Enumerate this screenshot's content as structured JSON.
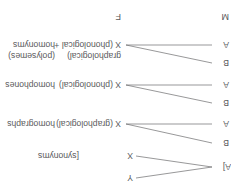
{
  "figure": {
    "orientation": "rotated-180",
    "background_color": "#ffffff",
    "text_color": "#59595b",
    "line_color": "#6b6b6d"
  },
  "headers": {
    "meaning": "M",
    "form": "F"
  },
  "rows": [
    {
      "id": "synonyms",
      "meaning_labels": [
        "A]"
      ],
      "form_labels": [
        "X",
        "Y"
      ],
      "relation_label": "[synonyms",
      "relation_label_full": "[synonyms]",
      "link_type": "one-to-many"
    },
    {
      "id": "homographs",
      "meaning_labels": [
        "A",
        "B"
      ],
      "form_labels": [
        "X (graphological)"
      ],
      "relation_label": "homographs",
      "link_type": "many-to-one"
    },
    {
      "id": "homophones",
      "meaning_labels": [
        "A",
        "B"
      ],
      "form_labels": [
        "X (phonological)"
      ],
      "relation_label": "homophones",
      "link_type": "many-to-one"
    },
    {
      "id": "homonyms",
      "meaning_labels": [
        "A",
        "B"
      ],
      "form_labels": [
        "X (phonological + graphological)"
      ],
      "form_label_line1": "X (phonological +",
      "form_label_line2": "graphological)",
      "relation_label_line1": "homonyms",
      "relation_label_line2": "(polysemes)",
      "link_type": "many-to-one"
    }
  ]
}
